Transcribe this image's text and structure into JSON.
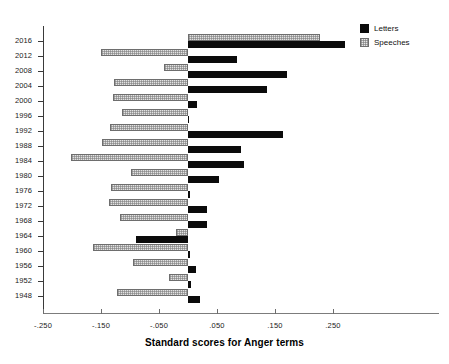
{
  "chart_data": {
    "type": "bar",
    "orientation": "horizontal",
    "title": "",
    "xlabel": "Standard scores for Anger terms",
    "ylabel": "",
    "xlim": [
      -0.25,
      0.31
    ],
    "xticks": [
      -0.25,
      -0.15,
      -0.05,
      0.05,
      0.15,
      0.25
    ],
    "xticklabels": [
      "-.250",
      "-.150",
      "-.050",
      ".050",
      ".150",
      ".250"
    ],
    "grid": false,
    "legend_position": "top-right",
    "categories": [
      "2016",
      "2012",
      "2008",
      "2004",
      "2000",
      "1996",
      "1992",
      "1988",
      "1984",
      "1980",
      "1976",
      "1972",
      "1968",
      "1964",
      "1960",
      "1956",
      "1952",
      "1948"
    ],
    "series": [
      {
        "name": "Letters",
        "color": "#0b0b0b",
        "values": [
          0.27,
          0.084,
          0.17,
          0.137,
          0.016,
          0.002,
          0.163,
          0.091,
          0.096,
          0.053,
          0.003,
          0.032,
          0.032,
          -0.089,
          0.003,
          0.013,
          0.006,
          0.02
        ]
      },
      {
        "name": "Speeches",
        "color": "#e2e2e2",
        "values": [
          0.228,
          -0.15,
          -0.042,
          -0.128,
          -0.13,
          -0.114,
          -0.135,
          -0.149,
          -0.202,
          -0.099,
          -0.132,
          -0.137,
          -0.118,
          -0.021,
          -0.163,
          -0.094,
          -0.033,
          -0.123
        ]
      }
    ]
  },
  "legend": {
    "items": [
      {
        "label": "Letters",
        "swatch": "solid-black-square"
      },
      {
        "label": "Speeches",
        "swatch": "hatched-light-square"
      }
    ]
  },
  "axis": {
    "title": "Standard scores for Anger terms"
  }
}
